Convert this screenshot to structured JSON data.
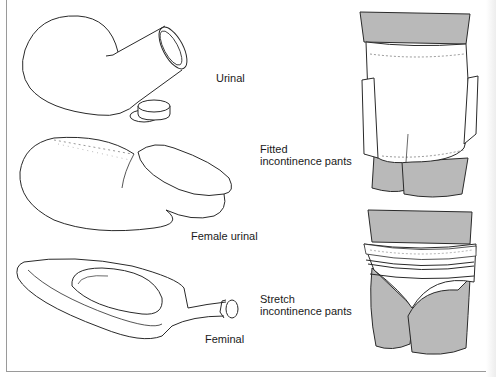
{
  "page": {
    "top_fragment": "· · · · · ·  · · · ·  · · · · · · · ·"
  },
  "items": [
    {
      "id": "urinal",
      "label": "Urinal"
    },
    {
      "id": "female-urinal",
      "label": "Female urinal"
    },
    {
      "id": "feminal",
      "label": "Feminal"
    },
    {
      "id": "fitted-pants",
      "label_line1": "Fitted",
      "label_line2": "incontinence pants"
    },
    {
      "id": "stretch-pants",
      "label_line1": "Stretch",
      "label_line2": "incontinence pants"
    }
  ],
  "colors": {
    "line": "#2a2a2a",
    "fill_grey": "#b9b9b9",
    "frame": "#9a9a9a",
    "background": "#ffffff"
  }
}
